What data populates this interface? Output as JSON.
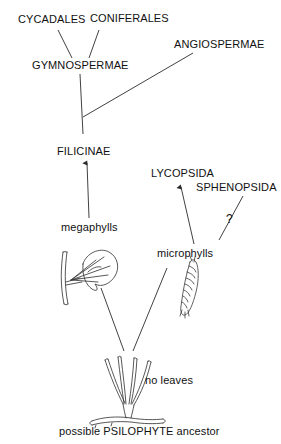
{
  "figure": {
    "background_color": "#ffffff",
    "line_color": "#2b2b2b",
    "text_color": "#111111"
  },
  "taxa": {
    "cycadales": "CYCADALES",
    "coniferales": "CONIFERALES",
    "angiospermae": "ANGIOSPERMAE",
    "gymnospermae": "GYMNOSPERMAE",
    "filicinae": "FILICINAE",
    "lycopsida": "LYCOPSIDA",
    "sphenopsida": "SPHENOPSIDA"
  },
  "terms": {
    "megaphylls": "megaphylls",
    "microphylls": "microphylls",
    "no_leaves": "no leaves",
    "uncertain": "?"
  },
  "caption": {
    "ancestor": "possible PSILOPHYTE ancestor"
  },
  "illustrations": {
    "megaphyll_plant": "megaphyll-leaf-drawing",
    "microphyll_plant": "microphyll-shoot-drawing",
    "psilophyte_plant": "psilophyte-drawing"
  },
  "connections": [
    {
      "from": "gymnospermae",
      "to": "cycadales"
    },
    {
      "from": "gymnospermae",
      "to": "coniferales"
    },
    {
      "from": "filicinae-node",
      "to": "gymnospermae"
    },
    {
      "from": "filicinae-node",
      "to": "angiospermae"
    },
    {
      "from": "megaphylls",
      "to": "filicinae"
    },
    {
      "from": "microphylls",
      "to": "lycopsida"
    },
    {
      "from": "microphylls",
      "to": "sphenopsida"
    },
    {
      "from": "psilophyte",
      "to": "megaphylls"
    },
    {
      "from": "psilophyte",
      "to": "microphylls"
    }
  ]
}
